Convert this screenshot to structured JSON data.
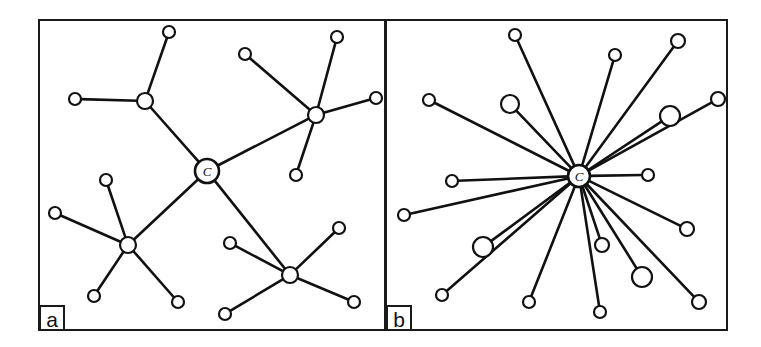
{
  "figure": {
    "width": 761,
    "height": 347,
    "background_color": "#ffffff",
    "ink_color": "#111111"
  },
  "panels": [
    {
      "id": "panel-a",
      "label": "a",
      "label_box": {
        "x": 40,
        "y": 306,
        "w": 24,
        "h": 24
      },
      "frame": {
        "x": 39,
        "y": 20,
        "w": 346,
        "h": 310
      },
      "center_label": "C"
    },
    {
      "id": "panel-b",
      "label": "b",
      "label_box": {
        "x": 387,
        "y": 306,
        "w": 24,
        "h": 24
      },
      "frame": {
        "x": 386,
        "y": 20,
        "w": 341,
        "h": 310
      },
      "center_label": "C"
    }
  ],
  "chart_data": {
    "type": "diagram",
    "title": "",
    "subtitle": "",
    "xlabel": "",
    "ylabel": "",
    "legend": [],
    "annotations": [
      "a",
      "b",
      "C",
      "C"
    ],
    "panels": [
      {
        "name": "a",
        "topology": "hierarchical-tree",
        "center_node": {
          "id": "a-C",
          "x": 207,
          "y": 171,
          "r": 12,
          "label": "C",
          "size": "center"
        },
        "hub_nodes": [
          {
            "id": "a-h1",
            "x": 145,
            "y": 101,
            "r": 8,
            "size": "medium"
          },
          {
            "id": "a-h2",
            "x": 316,
            "y": 115,
            "r": 8,
            "size": "medium"
          },
          {
            "id": "a-h3",
            "x": 128,
            "y": 245,
            "r": 8,
            "size": "medium"
          },
          {
            "id": "a-h4",
            "x": 290,
            "y": 275,
            "r": 8,
            "size": "medium"
          }
        ],
        "leaf_nodes": [
          {
            "id": "a-l1",
            "x": 169,
            "y": 32,
            "r": 6,
            "size": "small",
            "parent": "a-h1"
          },
          {
            "id": "a-l2",
            "x": 75,
            "y": 99,
            "r": 6,
            "size": "small",
            "parent": "a-h1"
          },
          {
            "id": "a-l3",
            "x": 337,
            "y": 37,
            "r": 6,
            "size": "small",
            "parent": "a-h2"
          },
          {
            "id": "a-l4",
            "x": 245,
            "y": 54,
            "r": 6,
            "size": "small",
            "parent": "a-h2"
          },
          {
            "id": "a-l5",
            "x": 376,
            "y": 98,
            "r": 6,
            "size": "small",
            "parent": "a-h2"
          },
          {
            "id": "a-l6",
            "x": 296,
            "y": 175,
            "r": 6,
            "size": "small",
            "parent": "a-h2"
          },
          {
            "id": "a-l7",
            "x": 106,
            "y": 180,
            "r": 6,
            "size": "small",
            "parent": "a-h3"
          },
          {
            "id": "a-l8",
            "x": 55,
            "y": 213,
            "r": 6,
            "size": "small",
            "parent": "a-h3"
          },
          {
            "id": "a-l9",
            "x": 94,
            "y": 296,
            "r": 6,
            "size": "small",
            "parent": "a-h3"
          },
          {
            "id": "a-l10",
            "x": 178,
            "y": 302,
            "r": 6,
            "size": "small",
            "parent": "a-h3"
          },
          {
            "id": "a-l11",
            "x": 230,
            "y": 243,
            "r": 6,
            "size": "small",
            "parent": "a-h4"
          },
          {
            "id": "a-l12",
            "x": 339,
            "y": 228,
            "r": 6,
            "size": "small",
            "parent": "a-h4"
          },
          {
            "id": "a-l13",
            "x": 354,
            "y": 302,
            "r": 6,
            "size": "small",
            "parent": "a-h4"
          },
          {
            "id": "a-l14",
            "x": 225,
            "y": 314,
            "r": 6,
            "size": "small",
            "parent": "a-h4"
          }
        ],
        "edges": [
          [
            "a-C",
            "a-h1"
          ],
          [
            "a-C",
            "a-h2"
          ],
          [
            "a-C",
            "a-h3"
          ],
          [
            "a-C",
            "a-h4"
          ],
          [
            "a-h1",
            "a-l1"
          ],
          [
            "a-h1",
            "a-l2"
          ],
          [
            "a-h2",
            "a-l3"
          ],
          [
            "a-h2",
            "a-l4"
          ],
          [
            "a-h2",
            "a-l5"
          ],
          [
            "a-h2",
            "a-l6"
          ],
          [
            "a-h3",
            "a-l7"
          ],
          [
            "a-h3",
            "a-l8"
          ],
          [
            "a-h3",
            "a-l9"
          ],
          [
            "a-h3",
            "a-l10"
          ],
          [
            "a-h4",
            "a-l11"
          ],
          [
            "a-h4",
            "a-l12"
          ],
          [
            "a-h4",
            "a-l13"
          ],
          [
            "a-h4",
            "a-l14"
          ]
        ],
        "node_count": 19,
        "edge_count": 18
      },
      {
        "name": "b",
        "topology": "star",
        "center_node": {
          "id": "b-C",
          "x": 579,
          "y": 176,
          "r": 11,
          "label": "C",
          "size": "center"
        },
        "hub_nodes": [],
        "leaf_nodes": [
          {
            "id": "b-l1",
            "x": 515,
            "y": 35,
            "r": 6,
            "size": "small"
          },
          {
            "id": "b-l2",
            "x": 615,
            "y": 55,
            "r": 6,
            "size": "small"
          },
          {
            "id": "b-l3",
            "x": 678,
            "y": 41,
            "r": 7,
            "size": "small"
          },
          {
            "id": "b-l4",
            "x": 429,
            "y": 100,
            "r": 6,
            "size": "small"
          },
          {
            "id": "b-l5",
            "x": 510,
            "y": 104,
            "r": 9,
            "size": "large"
          },
          {
            "id": "b-l6",
            "x": 670,
            "y": 116,
            "r": 10,
            "size": "large"
          },
          {
            "id": "b-l7",
            "x": 718,
            "y": 99,
            "r": 7,
            "size": "small"
          },
          {
            "id": "b-l8",
            "x": 452,
            "y": 181,
            "r": 6,
            "size": "small"
          },
          {
            "id": "b-l9",
            "x": 648,
            "y": 175,
            "r": 6,
            "size": "small"
          },
          {
            "id": "b-l10",
            "x": 404,
            "y": 215,
            "r": 6,
            "size": "small"
          },
          {
            "id": "b-l11",
            "x": 687,
            "y": 229,
            "r": 7,
            "size": "small"
          },
          {
            "id": "b-l12",
            "x": 483,
            "y": 247,
            "r": 10,
            "size": "large"
          },
          {
            "id": "b-l13",
            "x": 602,
            "y": 245,
            "r": 7,
            "size": "small"
          },
          {
            "id": "b-l14",
            "x": 642,
            "y": 277,
            "r": 10,
            "size": "large"
          },
          {
            "id": "b-l15",
            "x": 442,
            "y": 295,
            "r": 6,
            "size": "small"
          },
          {
            "id": "b-l16",
            "x": 529,
            "y": 302,
            "r": 6,
            "size": "small"
          },
          {
            "id": "b-l17",
            "x": 699,
            "y": 302,
            "r": 7,
            "size": "small"
          },
          {
            "id": "b-l18",
            "x": 600,
            "y": 312,
            "r": 6,
            "size": "small"
          }
        ],
        "edges": [
          [
            "b-C",
            "b-l1"
          ],
          [
            "b-C",
            "b-l2"
          ],
          [
            "b-C",
            "b-l3"
          ],
          [
            "b-C",
            "b-l4"
          ],
          [
            "b-C",
            "b-l5"
          ],
          [
            "b-C",
            "b-l6"
          ],
          [
            "b-C",
            "b-l7"
          ],
          [
            "b-C",
            "b-l8"
          ],
          [
            "b-C",
            "b-l9"
          ],
          [
            "b-C",
            "b-l10"
          ],
          [
            "b-C",
            "b-l11"
          ],
          [
            "b-C",
            "b-l12"
          ],
          [
            "b-C",
            "b-l13"
          ],
          [
            "b-C",
            "b-l14"
          ],
          [
            "b-C",
            "b-l15"
          ],
          [
            "b-C",
            "b-l16"
          ],
          [
            "b-C",
            "b-l17"
          ],
          [
            "b-C",
            "b-l18"
          ]
        ],
        "node_count": 19,
        "edge_count": 18
      }
    ]
  }
}
